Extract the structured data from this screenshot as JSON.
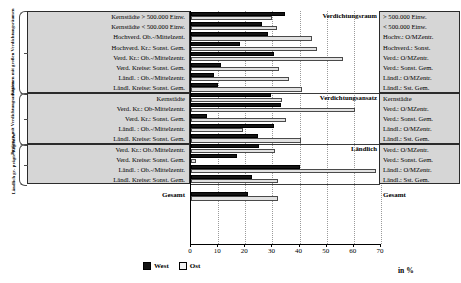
{
  "chart_data": {
    "type": "bar",
    "orientation": "horizontal",
    "title": "",
    "xlabel": "in %",
    "ylabel": "",
    "xlim": [
      0,
      70
    ],
    "xticks": [
      0,
      10,
      20,
      30,
      40,
      50,
      60,
      70
    ],
    "grid": true,
    "legend_position": "bottom",
    "series": [
      {
        "name": "West",
        "color": "#141414"
      },
      {
        "name": "Ost",
        "color": "#e2e2e2"
      }
    ],
    "groups": [
      {
        "bracket_label": "Regionen mit großen Verdichtungsräumen",
        "section_title": "Verdichtungsraum",
        "rows": [
          {
            "label_long": "Kernstädte > 500.000 Einw.",
            "label_short": "> 500.000 Einw.",
            "West": 34.5,
            "Ost": 30.0
          },
          {
            "label_long": "Kernstädte < 500.000 Einw.",
            "label_short": "< 500.000 Einw.",
            "West": 26.0,
            "Ost": 31.5
          },
          {
            "label_long": "Hochverd. Ob.-/Mittelzent.",
            "label_short": "Hochv.: O/MZentr.",
            "West": 28.5,
            "Ost": 44.5
          },
          {
            "label_long": "Hochverd. Kr.: Sonst. Gem.",
            "label_short": "Hochverd.: Sonst.",
            "West": 18.0,
            "Ost": 46.5
          },
          {
            "label_long": "Verd. Kr.: Ob.-/Mittelzentr.",
            "label_short": "Verd.: O/MZentr.",
            "West": 30.5,
            "Ost": 56.0
          },
          {
            "label_long": "Verd. Kreise: Sonst. Gem.",
            "label_short": "Verd.: Sonst. Gem.",
            "West": 11.0,
            "Ost": 32.5
          },
          {
            "label_long": "Ländl. : Ob.-/Mittelzentr.",
            "label_short": "Ländl.: O/MZentr.",
            "West": 8.5,
            "Ost": 36.0
          },
          {
            "label_long": "Ländl. Kreise: Sonst. Gem.",
            "label_short": "Ländl.: Sst. Gem.",
            "West": 10.0,
            "Ost": 41.0
          }
        ]
      },
      {
        "bracket_label": "Regionen mit Verdichtungsansätzen",
        "section_title": "Verdichtungsansatz",
        "rows": [
          {
            "label_long": "Kernstädte",
            "label_short": "Kernstädte",
            "West": 29.5,
            "Ost": 33.5
          },
          {
            "label_long": "Verd. Kr.: Ob-Mittelzentr.",
            "label_short": "Verd.: O/MZentr.",
            "West": 33.0,
            "Ost": 60.5
          },
          {
            "label_long": "Verd. Kr.: Sonst. Gem.",
            "label_short": "Verd.: Sonst. Gem.",
            "West": 6.0,
            "Ost": 35.0
          },
          {
            "label_long": "Ländl. : Ob.-/Mittelzentr.",
            "label_short": "Ländl.: O/MZentr.",
            "West": 30.5,
            "Ost": 19.0
          },
          {
            "label_long": "Ländl. Kreise: Sonst. Gem.",
            "label_short": "Ländl.: Sst. Gem.",
            "West": 24.5,
            "Ost": 40.5
          }
        ]
      },
      {
        "bracket_label": "Ländlich ge- prägte Regionen",
        "section_title": "Ländlich",
        "rows": [
          {
            "label_long": "Verd. Kr.: Ob./Mittelzentr.",
            "label_short": "Verd.: O/MZentr.",
            "West": 25.0,
            "Ost": 31.0
          },
          {
            "label_long": "Verd. Kreise: Sonst. Gem.",
            "label_short": "Verd.: Sonst. Gem.",
            "West": 17.0,
            "Ost": 2.0
          },
          {
            "label_long": "Ländl. : Ob.-/Mittelzentr.",
            "label_short": "Ländl.: O/MZentr.",
            "West": 40.0,
            "Ost": 68.0
          },
          {
            "label_long": "Ländl. Kreise: Sonst. Gem.",
            "label_short": "Ländl.: Sst. Gem.",
            "West": 22.5,
            "Ost": 32.0
          }
        ]
      }
    ],
    "total_row": {
      "label": "Gesamt",
      "label_right": "Gesamt",
      "West": 21.0,
      "Ost": 32.0
    }
  }
}
